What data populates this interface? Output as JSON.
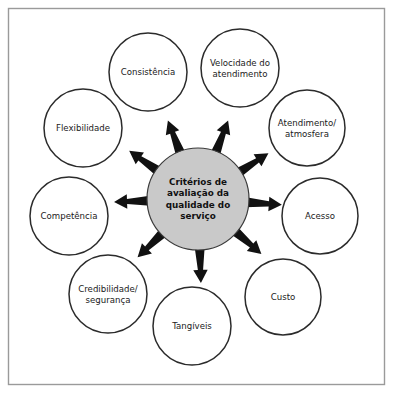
{
  "diagram": {
    "type": "hub-and-spoke",
    "colors": {
      "hub_fill": "#c9c9c9",
      "node_fill": "#ffffff",
      "stroke": "#2b2b2b",
      "arrow": "#111111",
      "frame": "#9a9a9a",
      "background": "#ffffff"
    },
    "hub": {
      "name": "criterios-hub",
      "lines": [
        "Critérios de",
        "avaliação da",
        "qualidade do",
        "serviço"
      ],
      "cx": 198,
      "cy": 199,
      "r": 51
    },
    "nodes": [
      {
        "id": "consistencia",
        "lines": [
          "Consistência"
        ],
        "cx": 148,
        "cy": 72,
        "r": 39,
        "angle": -111
      },
      {
        "id": "velocidade-do-atendimento",
        "lines": [
          "Velocidade do",
          "atendimento"
        ],
        "cx": 240,
        "cy": 68,
        "r": 39,
        "angle": -69
      },
      {
        "id": "atendimento-atmosfera",
        "lines": [
          "Atendimento/",
          "atmosfera"
        ],
        "cx": 307,
        "cy": 128,
        "r": 38,
        "angle": -33
      },
      {
        "id": "acesso",
        "lines": [
          "Acesso"
        ],
        "cx": 320,
        "cy": 216,
        "r": 38,
        "angle": 4
      },
      {
        "id": "custo",
        "lines": [
          "Custo"
        ],
        "cx": 283,
        "cy": 297,
        "r": 38,
        "angle": 41
      },
      {
        "id": "tangiveis",
        "lines": [
          "Tangíveis"
        ],
        "cx": 192,
        "cy": 326,
        "r": 39,
        "angle": 88
      },
      {
        "id": "credibilidade-seguranca",
        "lines": [
          "Credibilidade/",
          "segurança"
        ],
        "cx": 108,
        "cy": 294,
        "r": 39,
        "angle": 136
      },
      {
        "id": "competencia",
        "lines": [
          "Competência"
        ],
        "cx": 69,
        "cy": 216,
        "r": 39,
        "angle": 178
      },
      {
        "id": "flexibilidade",
        "lines": [
          "Flexibilidade"
        ],
        "cx": 83,
        "cy": 128,
        "r": 39,
        "angle": -145
      }
    ]
  }
}
